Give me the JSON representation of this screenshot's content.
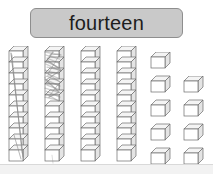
{
  "page": {
    "background_color": "#ffffff",
    "width": 213,
    "height": 174
  },
  "header": {
    "word": "fourteen",
    "box_fill": "#c9c9c9",
    "box_border": "#8e8e8e",
    "text_color": "#1d1d1d"
  },
  "blocks": {
    "cube_face_fill": "#ffffff",
    "cube_top_fill": "#f4f4f4",
    "cube_side_fill": "#e4e4e4",
    "cube_stroke": "#6b6b6b",
    "rods": [
      {
        "name": "rod-1",
        "cubes": 10,
        "x": 8,
        "y": 0,
        "marked": true,
        "mark_type": "diagonal-pencil-line",
        "mark_color": "#8c8c8c"
      },
      {
        "name": "rod-2",
        "cubes": 10,
        "x": 44,
        "y": 0,
        "marked": true,
        "mark_type": "heavy-pencil-scribble",
        "mark_color": "#7f7f7f"
      },
      {
        "name": "rod-3",
        "cubes": 10,
        "x": 80,
        "y": 0,
        "marked": false,
        "mark_type": "",
        "mark_color": ""
      },
      {
        "name": "rod-4",
        "cubes": 10,
        "x": 116,
        "y": 0,
        "marked": false,
        "mark_type": "",
        "mark_color": ""
      }
    ],
    "loose_columns": [
      {
        "name": "loose-column-left",
        "cubes": 5,
        "x": 150,
        "y": 6,
        "spacing": 24
      },
      {
        "name": "loose-column-right",
        "cubes": 4,
        "x": 183,
        "y": 30,
        "spacing": 24
      }
    ],
    "totals": {
      "rod_value": 10,
      "rod_count": 4,
      "loose_cube_count": 9
    }
  },
  "bottom_strip": {
    "fill": "#f2f2f2",
    "border": "#d9d9d9"
  }
}
